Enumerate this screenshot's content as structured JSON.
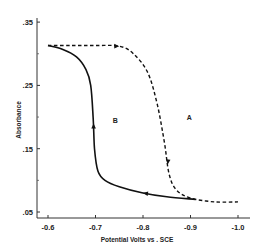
{
  "chart_data": {
    "type": "line",
    "title": "",
    "xlabel": "Potential      Volts   vs  .  SCE",
    "ylabel": "Absorbance",
    "xlim": [
      -0.6,
      -1.0
    ],
    "ylim": [
      0.05,
      0.35
    ],
    "x_ticks": [
      -0.6,
      -0.7,
      -0.8,
      -0.9,
      -1.0
    ],
    "x_tick_labels": [
      "-0.6",
      "-0.7",
      "-0.8",
      "-0.9",
      "-1.0"
    ],
    "y_ticks": [
      0.05,
      0.15,
      0.25,
      0.35
    ],
    "y_tick_labels": [
      ".05",
      ".15",
      ".25",
      ".35"
    ],
    "y_minor_ticks": [
      0.1,
      0.2,
      0.3
    ],
    "grid": false,
    "legend": "none",
    "series": [
      {
        "name": "A",
        "style": "dashed",
        "direction": "forward (cathodic sweep, -0.6 to -1.0 V)",
        "x": [
          -0.6,
          -0.65,
          -0.7,
          -0.75,
          -0.78,
          -0.81,
          -0.83,
          -0.845,
          -0.855,
          -0.87,
          -0.9,
          -0.95,
          -1.0
        ],
        "y": [
          0.313,
          0.313,
          0.313,
          0.312,
          0.3,
          0.27,
          0.22,
          0.16,
          0.11,
          0.085,
          0.072,
          0.066,
          0.066
        ]
      },
      {
        "name": "B",
        "style": "solid",
        "direction": "reverse (anodic sweep, -0.91 to -0.6 V)",
        "x": [
          -0.91,
          -0.85,
          -0.8,
          -0.75,
          -0.72,
          -0.705,
          -0.698,
          -0.695,
          -0.69,
          -0.68,
          -0.66,
          -0.63,
          -0.6
        ],
        "y": [
          0.07,
          0.074,
          0.08,
          0.09,
          0.1,
          0.115,
          0.15,
          0.2,
          0.25,
          0.275,
          0.295,
          0.307,
          0.313
        ]
      }
    ],
    "annotations": [
      {
        "text": "A",
        "x": -0.875,
        "y": 0.195
      },
      {
        "text": "B",
        "x": -0.715,
        "y": 0.19
      }
    ]
  }
}
